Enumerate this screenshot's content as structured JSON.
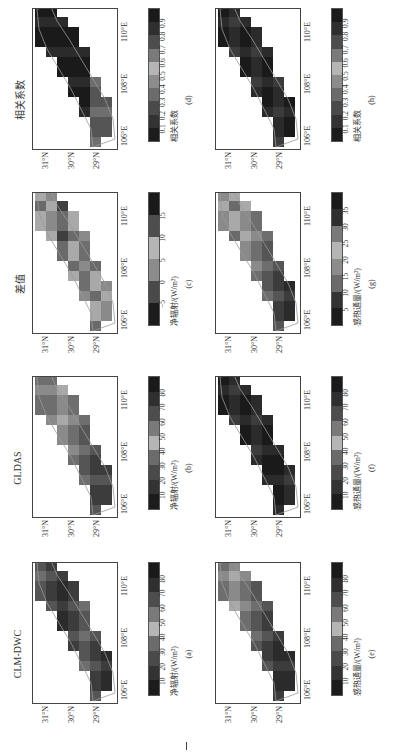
{
  "figure": {
    "lat_ticks": [
      "31°N",
      "30°N",
      "29°N"
    ],
    "lon_ticks": [
      "106°E",
      "108°E",
      "110°E"
    ]
  },
  "panels": [
    {
      "id": "a",
      "title": "CLM-DWC",
      "caption": "(a)",
      "cbar_label": "净辐射/(W/m²)",
      "cbar_ticks": [
        "10",
        "20",
        "30",
        "40",
        "50",
        "60",
        "70",
        "80"
      ]
    },
    {
      "id": "b",
      "title": "GLDAS",
      "caption": "(b)",
      "cbar_label": "净辐射/(W/m²)",
      "cbar_ticks": [
        "10",
        "20",
        "30",
        "40",
        "50",
        "60",
        "70",
        "80"
      ]
    },
    {
      "id": "c",
      "title": "差值",
      "caption": "(c)",
      "cbar_label": "净辐射/(W/m²)",
      "cbar_ticks": [
        "−5",
        "0",
        "5",
        "10",
        "15"
      ]
    },
    {
      "id": "d",
      "title": "相关系数",
      "caption": "(d)",
      "cbar_label": "相关系数",
      "cbar_ticks": [
        "0.1",
        "0.2",
        "0.3",
        "0.4",
        "0.5",
        "0.6",
        "0.7",
        "0.8",
        "0.9"
      ]
    },
    {
      "id": "e",
      "title": "",
      "caption": "(e)",
      "cbar_label": "感热通量/(W/m²)",
      "cbar_ticks": [
        "10",
        "20",
        "30",
        "40",
        "50",
        "60",
        "70",
        "80"
      ]
    },
    {
      "id": "f",
      "title": "",
      "caption": "(f)",
      "cbar_label": "感热通量/(W/m²)",
      "cbar_ticks": [
        "10",
        "20",
        "30",
        "40",
        "50",
        "60",
        "70",
        "80"
      ]
    },
    {
      "id": "g",
      "title": "",
      "caption": "(g)",
      "cbar_label": "感热通量/(W/m²)",
      "cbar_ticks": [
        "5",
        "10",
        "15",
        "20",
        "25",
        "30",
        "35"
      ]
    },
    {
      "id": "h",
      "title": "",
      "caption": "(h)",
      "cbar_label": "相关系数",
      "cbar_ticks": [
        "0.1",
        "0.2",
        "0.3",
        "0.4",
        "0.5",
        "0.6",
        "0.7",
        "0.8",
        "0.9"
      ]
    }
  ],
  "chart_data": [
    {
      "type": "heatmap",
      "panel": "a",
      "title": "CLM-DWC",
      "variable": "净辐射",
      "units": "W/m²",
      "xlabel": "Longitude",
      "ylabel": "Latitude",
      "x_ticks": [
        "106°E",
        "108°E",
        "110°E"
      ],
      "y_ticks": [
        "29°N",
        "30°N",
        "31°N"
      ],
      "color_range": [
        0,
        90
      ],
      "legend_ticks": [
        10,
        20,
        30,
        40,
        50,
        60,
        70,
        80
      ],
      "dominant_values": "mostly 40–80, higher (70–80) in the north-east"
    },
    {
      "type": "heatmap",
      "panel": "b",
      "title": "GLDAS",
      "variable": "净辐射",
      "units": "W/m²",
      "x_ticks": [
        "106°E",
        "108°E",
        "110°E"
      ],
      "y_ticks": [
        "29°N",
        "30°N",
        "31°N"
      ],
      "color_range": [
        0,
        90
      ],
      "legend_ticks": [
        10,
        20,
        30,
        40,
        50,
        60,
        70,
        80
      ],
      "dominant_values": "mostly 40–50, ~55 patch near 107.5°E, 70–80 in far east"
    },
    {
      "type": "heatmap",
      "panel": "c",
      "title": "差值",
      "variable": "净辐射差值",
      "units": "W/m²",
      "x_ticks": [
        "106°E",
        "108°E",
        "110°E"
      ],
      "y_ticks": [
        "29°N",
        "30°N",
        "31°N"
      ],
      "color_range": [
        -10,
        20
      ],
      "legend_ticks": [
        -5,
        0,
        5,
        10,
        15
      ],
      "dominant_values": "mostly 0–10 with scattered 10–20 cells"
    },
    {
      "type": "heatmap",
      "panel": "d",
      "title": "相关系数",
      "variable": "相关系数",
      "units": "",
      "x_ticks": [
        "106°E",
        "108°E",
        "110°E"
      ],
      "y_ticks": [
        "29°N",
        "30°N",
        "31°N"
      ],
      "color_range": [
        0,
        1
      ],
      "legend_ticks": [
        0.1,
        0.2,
        0.3,
        0.4,
        0.5,
        0.6,
        0.7,
        0.8,
        0.9
      ],
      "dominant_values": "mostly 0.9+, ~0.7 in south-west"
    },
    {
      "type": "heatmap",
      "panel": "e",
      "variable": "感热通量 (CLM-DWC)",
      "units": "W/m²",
      "x_ticks": [
        "106°E",
        "108°E",
        "110°E"
      ],
      "y_ticks": [
        "29°N",
        "30°N",
        "31°N"
      ],
      "color_range": [
        0,
        90
      ],
      "legend_ticks": [
        10,
        20,
        30,
        40,
        50,
        60,
        70,
        80
      ],
      "dominant_values": "10–30 in south-west, 40–60 in north-east"
    },
    {
      "type": "heatmap",
      "panel": "f",
      "variable": "感热通量 (GLDAS)",
      "units": "W/m²",
      "x_ticks": [
        "106°E",
        "108°E",
        "110°E"
      ],
      "y_ticks": [
        "29°N",
        "30°N",
        "31°N"
      ],
      "color_range": [
        0,
        90
      ],
      "legend_ticks": [
        10,
        20,
        30,
        40,
        50,
        60,
        70,
        80
      ],
      "dominant_values": "mostly 0–20 everywhere"
    },
    {
      "type": "heatmap",
      "panel": "g",
      "variable": "感热通量差值",
      "units": "W/m²",
      "x_ticks": [
        "106°E",
        "108°E",
        "110°E"
      ],
      "y_ticks": [
        "29°N",
        "30°N",
        "31°N"
      ],
      "color_range": [
        0,
        40
      ],
      "legend_ticks": [
        5,
        10,
        15,
        20,
        25,
        30,
        35
      ],
      "dominant_values": "5–15 south-west, 20–35 north-east"
    },
    {
      "type": "heatmap",
      "panel": "h",
      "variable": "相关系数",
      "units": "",
      "x_ticks": [
        "106°E",
        "108°E",
        "110°E"
      ],
      "y_ticks": [
        "29°N",
        "30°N",
        "31°N"
      ],
      "color_range": [
        0,
        1
      ],
      "legend_ticks": [
        0.1,
        0.2,
        0.3,
        0.4,
        0.5,
        0.6,
        0.7,
        0.8,
        0.9
      ],
      "dominant_values": "mostly 0.8–1.0"
    }
  ]
}
